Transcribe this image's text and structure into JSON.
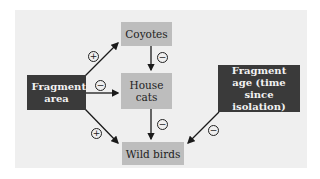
{
  "nodes": {
    "coyotes": {
      "label": "Coyotes"
    },
    "house_cats": {
      "label": "House cats"
    },
    "wild_birds": {
      "label": "Wild birds"
    },
    "fragment_area": {
      "label": "Fragment area"
    },
    "fragment_age": {
      "label": "Fragment age (time since isolation)"
    }
  },
  "edges": [
    {
      "from": "Fragment area",
      "to": "Coyotes",
      "sign": "+"
    },
    {
      "from": "Fragment area",
      "to": "House cats",
      "sign": "−"
    },
    {
      "from": "Fragment area",
      "to": "Wild birds",
      "sign": "+"
    },
    {
      "from": "Coyotes",
      "to": "House cats",
      "sign": "−"
    },
    {
      "from": "House cats",
      "to": "Wild birds",
      "sign": "−"
    },
    {
      "from": "Fragment age (time since isolation)",
      "to": "Wild birds",
      "sign": "−"
    }
  ],
  "signs": {
    "area_coyotes": "+",
    "area_cats": "−",
    "area_birds": "+",
    "coyotes_cats": "−",
    "cats_birds": "−",
    "age_birds": "−"
  },
  "colors": {
    "panel": "#efefef",
    "light_box": "#bdbdbd",
    "dark_box": "#3a3a3a",
    "arrow": "#1a1a1a"
  }
}
